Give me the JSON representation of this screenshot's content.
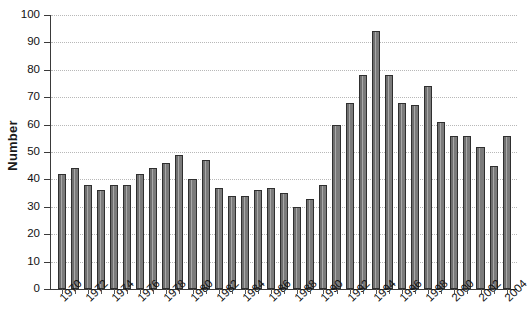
{
  "chart": {
    "type": "bar",
    "title": "",
    "ylabel": "Number",
    "xlabel": ""
  },
  "chart_data": {
    "type": "bar",
    "title": "",
    "xlabel": "",
    "ylabel": "Number",
    "ylim": [
      0,
      100
    ],
    "ytick_labels": [
      "0",
      "10",
      "20",
      "30",
      "40",
      "50",
      "60",
      "70",
      "80",
      "90",
      "100"
    ],
    "ytick_values": [
      0,
      10,
      20,
      30,
      40,
      50,
      60,
      70,
      80,
      90,
      100
    ],
    "grid": "horizontal-dotted",
    "legend": "none",
    "bar_color": "#7d7d7d",
    "bar_edge_color": "#2f2f2f",
    "xtick_labels": [
      "1970",
      "1972",
      "1974",
      "1976",
      "1978",
      "1980",
      "1982",
      "1984",
      "1986",
      "1988",
      "1990",
      "1992",
      "1994",
      "1996",
      "1998",
      "2000",
      "2002",
      "2004"
    ],
    "xtick_label_rotation": -45,
    "categories": [
      "1970",
      "1971",
      "1972",
      "1973",
      "1974",
      "1975",
      "1976",
      "1977",
      "1978",
      "1979",
      "1980",
      "1981",
      "1982",
      "1983",
      "1984",
      "1985",
      "1986",
      "1987",
      "1988",
      "1989",
      "1990",
      "1991",
      "1992",
      "1993",
      "1994",
      "1995",
      "1996",
      "1997",
      "1998",
      "1999",
      "2000",
      "2001",
      "2002",
      "2003",
      "2004"
    ],
    "values": [
      42,
      44,
      38,
      36,
      38,
      38,
      42,
      44,
      46,
      49,
      40,
      47,
      37,
      34,
      34,
      36,
      37,
      35,
      30,
      33,
      38,
      60,
      68,
      78,
      94,
      78,
      68,
      67,
      74,
      61,
      56,
      56,
      52,
      45,
      56
    ]
  }
}
